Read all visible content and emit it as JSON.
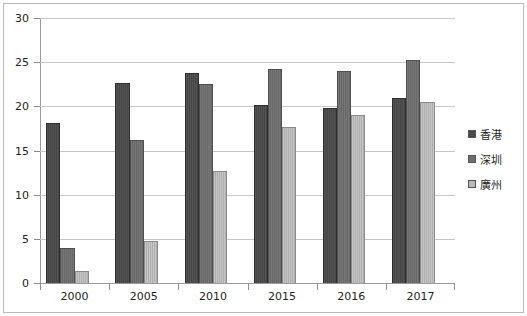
{
  "chart_data": {
    "type": "bar",
    "title": "",
    "xlabel": "",
    "ylabel": "",
    "categories": [
      "2000",
      "2005",
      "2010",
      "2015",
      "2016",
      "2017"
    ],
    "series": [
      {
        "name": "香港",
        "color": "#4a4a4a",
        "values": [
          18.1,
          22.6,
          23.8,
          20.1,
          19.8,
          20.9
        ]
      },
      {
        "name": "深圳",
        "color": "#6e6e6e",
        "values": [
          4.0,
          16.2,
          22.5,
          24.2,
          24.0,
          25.3
        ]
      },
      {
        "name": "廣州",
        "color": "#b8b8b8",
        "values": [
          1.4,
          4.7,
          12.7,
          17.7,
          19.0,
          20.5
        ]
      }
    ],
    "ylim": [
      0,
      30
    ],
    "ytick_step": 5,
    "yticks": [
      "30",
      "25",
      "20",
      "15",
      "10",
      "5",
      "0"
    ],
    "grid": true,
    "legend_position": "right"
  },
  "legend": {
    "items": [
      {
        "label": "香港",
        "swatch": "legend-swatch-hongkong"
      },
      {
        "label": "深圳",
        "swatch": "legend-swatch-shenzhen"
      },
      {
        "label": "廣州",
        "swatch": "legend-swatch-guangzhou"
      }
    ]
  }
}
